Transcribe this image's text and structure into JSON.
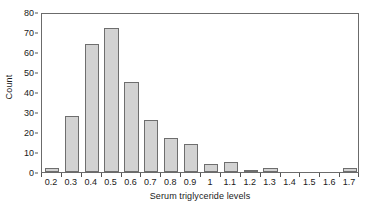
{
  "chart_data": {
    "type": "bar",
    "title": "",
    "subtitle": "",
    "xlabel": "Serum triglyceride levels",
    "ylabel": "Count",
    "categories": [
      "0.2",
      "0.3",
      "0.4",
      "0.5",
      "0.6",
      "0.7",
      "0.8",
      "0.9",
      "1",
      "1.1",
      "1.2",
      "1.3",
      "1.4",
      "1.5",
      "1.6",
      "1.7"
    ],
    "values": [
      2,
      28,
      64,
      72,
      45,
      26,
      17,
      14,
      4,
      5,
      1,
      2,
      0,
      0,
      0,
      2
    ],
    "ylim": [
      0,
      80
    ],
    "yticks": [
      0,
      10,
      20,
      30,
      40,
      50,
      60,
      70,
      80
    ],
    "ytick_labels": [
      "0",
      "10",
      "20",
      "30",
      "40",
      "50",
      "60",
      "70",
      "80"
    ],
    "xtick_labels": [
      "0.2",
      "0.3",
      "0.4",
      "0.5",
      "0.6",
      "0.7",
      "0.8",
      "0.9",
      "1",
      "1.1",
      "1.2",
      "1.3",
      "1.4",
      "1.5",
      "1.6",
      "1.7"
    ],
    "grid": false,
    "legend": null,
    "legend_position": "none",
    "bar_fill_color": "#d2d2d2",
    "bar_edge_color": "#6e6e6e",
    "axis_color": "#6b6b6b",
    "text_color": "#1a1a1a",
    "background_color": "#ffffff"
  }
}
